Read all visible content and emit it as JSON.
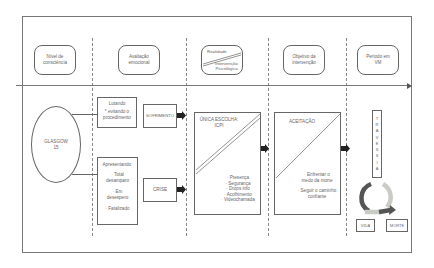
{
  "headers": [
    {
      "id": "nivel",
      "label_1": "Nível de",
      "label_2": "consciência"
    },
    {
      "id": "avaliacao",
      "label_1": "Avaliação",
      "label_2": "emocional"
    },
    {
      "id": "realidade",
      "top": "Realidade",
      "bottom_1": "Intervenção",
      "bottom_2": "Psicológica"
    },
    {
      "id": "objetivo",
      "label_1": "Objetivo da",
      "label_2": "intervenção"
    },
    {
      "id": "periodo",
      "label_1": "Período em",
      "label_2": "VM"
    }
  ],
  "glasgow": {
    "line_1": "GLASGOW",
    "line_2": "15"
  },
  "lutando": {
    "title": "Lutando",
    "line_1": "* evitando o",
    "line_2": "procedimento"
  },
  "apresentando": {
    "title": "Apresentando:",
    "items": [
      "· Total",
      "desamparo",
      "· Em",
      "desespero",
      "· Fatalizado"
    ]
  },
  "sofrimento": "SOFRIMENTO",
  "crise": "CRISE",
  "unica_escolha": {
    "title_1": "ÚNICA ESCOLHA:",
    "title_2": "ICPI",
    "items": [
      "· Presença",
      "· Segurança",
      "· Drops info",
      "· Acolhimento",
      "· Videochamada"
    ]
  },
  "aceitacao": {
    "title": "ACEITAÇÃO",
    "items": [
      "· Enfrentar o",
      "medo da morte",
      "· Seguir o caminho",
      "confiante"
    ]
  },
  "travessia": [
    "T",
    "R",
    "A",
    "V",
    "E",
    "S",
    "S",
    "I",
    "A"
  ],
  "outcomes": {
    "vida": "VIDA",
    "morte": "MORTE"
  },
  "colors": {
    "line": "#666666",
    "arrow": "#222222",
    "cycle_dark": "#555555",
    "cycle_light": "#c8ccc4"
  }
}
